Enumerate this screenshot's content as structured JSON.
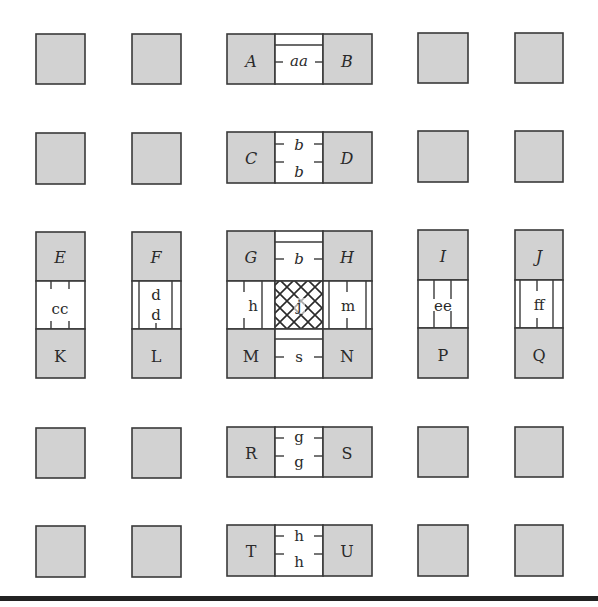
{
  "colors": {
    "gray_fill": "#d2d2d2",
    "stroke": "#3a3a3a",
    "white_fill": "#ffffff",
    "baseline": "#222222"
  },
  "grid": {
    "columns_x": [
      36,
      132,
      227,
      418,
      515
    ],
    "cell_w": 49,
    "rows_y": [
      33,
      132,
      231,
      427,
      526
    ],
    "cell_h": 50
  },
  "plain_squares": [
    {
      "row": 0,
      "col": 0
    },
    {
      "row": 0,
      "col": 1
    },
    {
      "row": 0,
      "col": 3
    },
    {
      "row": 0,
      "col": 4
    },
    {
      "row": 1,
      "col": 0
    },
    {
      "row": 1,
      "col": 1
    },
    {
      "row": 1,
      "col": 3
    },
    {
      "row": 1,
      "col": 4
    },
    {
      "row": 3,
      "col": 0
    },
    {
      "row": 3,
      "col": 1
    },
    {
      "row": 3,
      "col": 3
    },
    {
      "row": 3,
      "col": 4
    },
    {
      "row": 4,
      "col": 0
    },
    {
      "row": 4,
      "col": 1
    },
    {
      "row": 4,
      "col": 3
    },
    {
      "row": 4,
      "col": 4
    }
  ],
  "labels": {
    "A": "A",
    "B": "B",
    "C": "C",
    "D": "D",
    "E": "E",
    "F": "F",
    "G": "G",
    "H": "H",
    "I": "I",
    "J": "J",
    "K": "K",
    "L": "L",
    "M": "M",
    "N": "N",
    "P": "P",
    "Q": "Q",
    "R": "R",
    "S": "S",
    "T": "T",
    "U": "U"
  },
  "bands": {
    "aa": "aa",
    "b_upper": "b",
    "b_lower": "b",
    "b_center": "b",
    "s": "s",
    "g_upper": "g",
    "g_lower": "g",
    "h_upper": "h",
    "h_lower": "h",
    "cc": "cc",
    "d_upper": "d",
    "d_lower": "d",
    "h_left": "h",
    "j": "j",
    "m": "m",
    "ee": "ee",
    "ff": "ff"
  }
}
